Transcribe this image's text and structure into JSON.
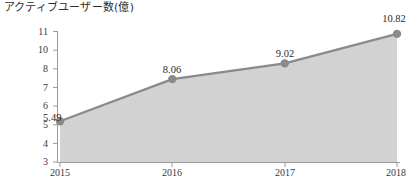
{
  "chart_data": {
    "type": "area",
    "title": "アクティブユーザー数(億)",
    "xlabel": "",
    "ylabel": "",
    "categories": [
      "2015",
      "2016",
      "2017",
      "2018"
    ],
    "values": [
      5.49,
      8.06,
      9.02,
      10.82
    ],
    "point_labels": [
      "5.49",
      "8.06",
      "9.02",
      "10.82"
    ],
    "series": [
      {
        "name": "アクティブユーザー数",
        "values": [
          5.49,
          8.06,
          9.02,
          10.82
        ]
      }
    ],
    "ytick_labels": [
      "11",
      "10",
      "8",
      "7",
      "6",
      "5",
      "4",
      "3"
    ],
    "xtick_labels": [
      "2015",
      "2016",
      "2017",
      "2018"
    ],
    "ylim": [
      3,
      11
    ],
    "grid": false,
    "legend": "none",
    "colors": {
      "fill": "#d2d2d2",
      "line": "#8a8a8a",
      "marker": "#8a8a8a",
      "axis": "#9a9a9a",
      "text": "#3a3a3a",
      "background": "#ffffff"
    }
  }
}
